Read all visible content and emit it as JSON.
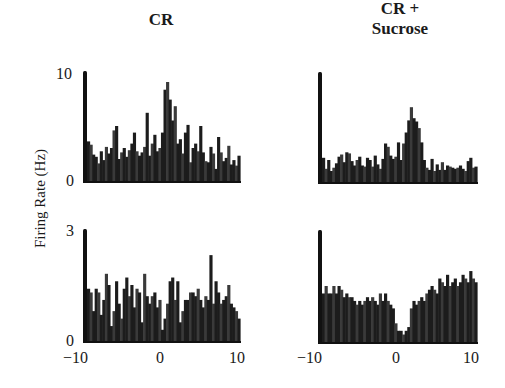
{
  "chart_data": [
    {
      "type": "bar",
      "panel": "top-left",
      "title": "CR",
      "ylabel": "Firing Rate (Hz)",
      "xlim": [
        -10,
        10
      ],
      "ylim": [
        0,
        10
      ],
      "yticks": [
        "0",
        "10"
      ],
      "xticks": [],
      "bin_start": -10,
      "bin_width": 0.333,
      "values": [
        3.6,
        3.3,
        2.4,
        2.2,
        1.6,
        2.7,
        1.9,
        3.1,
        2.5,
        3.0,
        4.6,
        5.0,
        2.0,
        2.6,
        3.0,
        2.2,
        2.8,
        3.4,
        4.4,
        2.7,
        2.3,
        2.6,
        3.1,
        6.2,
        2.3,
        3.4,
        4.2,
        2.7,
        3.0,
        4.4,
        8.3,
        9.0,
        7.4,
        5.5,
        6.8,
        3.4,
        3.8,
        2.5,
        4.4,
        5.1,
        1.7,
        3.0,
        3.4,
        2.7,
        5.0,
        2.6,
        1.8,
        1.7,
        3.1,
        2.5,
        1.1,
        4.0,
        2.6,
        1.8,
        2.1,
        3.2,
        1.5,
        1.9,
        1.4,
        2.3
      ]
    },
    {
      "type": "bar",
      "panel": "top-right",
      "title": "CR + Sucrose",
      "xlim": [
        -10,
        10
      ],
      "ylim": [
        0,
        10
      ],
      "yticks": [],
      "xticks": [],
      "bin_start": -10,
      "bin_width": 0.333,
      "values": [
        2.2,
        1.2,
        2.0,
        1.0,
        1.3,
        1.7,
        2.3,
        2.5,
        1.8,
        2.7,
        2.6,
        1.9,
        1.5,
        2.0,
        2.3,
        1.5,
        1.4,
        2.2,
        2.0,
        1.4,
        2.4,
        1.6,
        1.2,
        2.1,
        3.5,
        3.2,
        2.4,
        2.1,
        2.3,
        3.6,
        2.0,
        3.5,
        4.5,
        5.6,
        6.8,
        5.8,
        5.5,
        4.9,
        3.6,
        2.0,
        1.3,
        1.1,
        2.1,
        1.0,
        1.6,
        1.1,
        1.8,
        1.1,
        1.5,
        1.4,
        1.3,
        1.2,
        1.3,
        1.5,
        1.2,
        1.0,
        1.9,
        2.2,
        1.3,
        1.4
      ]
    },
    {
      "type": "bar",
      "panel": "bottom-left",
      "title": "CR",
      "xlim": [
        -10,
        10
      ],
      "ylim": [
        0,
        3
      ],
      "yticks": [
        "0",
        "3"
      ],
      "xticks": [
        "-10",
        "0",
        "10"
      ],
      "xlabel": "",
      "bin_start": -10,
      "bin_width": 0.333,
      "values": [
        1.4,
        1.3,
        0.8,
        1.4,
        1.3,
        0.7,
        1.1,
        1.8,
        1.5,
        0.4,
        0.8,
        1.6,
        1.0,
        0.6,
        1.4,
        1.7,
        1.2,
        1.5,
        0.9,
        1.4,
        1.3,
        0.5,
        1.8,
        1.2,
        1.0,
        1.2,
        1.3,
        0.9,
        1.1,
        0.3,
        0.6,
        1.0,
        1.6,
        1.7,
        1.1,
        1.6,
        0.5,
        0.8,
        1.1,
        1.1,
        1.3,
        1.3,
        1.2,
        1.4,
        1.1,
        0.9,
        1.2,
        1.1,
        2.3,
        1.0,
        1.6,
        1.3,
        1.0,
        1.1,
        1.2,
        1.5,
        1.0,
        0.9,
        0.8,
        0.6
      ]
    },
    {
      "type": "bar",
      "panel": "bottom-right",
      "title": "CR + Sucrose",
      "xlim": [
        -10,
        10
      ],
      "ylim": [
        0,
        3
      ],
      "yticks": [],
      "xticks": [
        "-10",
        "0",
        "10"
      ],
      "bin_start": -10,
      "bin_width": 0.333,
      "values": [
        1.3,
        1.5,
        1.3,
        1.3,
        1.5,
        1.3,
        1.5,
        1.4,
        1.2,
        1.3,
        1.2,
        1.2,
        1.1,
        1.0,
        1.1,
        1.0,
        1.1,
        1.2,
        1.1,
        1.2,
        1.1,
        1.0,
        1.3,
        1.1,
        1.3,
        1.1,
        1.0,
        0.9,
        0.5,
        0.3,
        0.3,
        0.2,
        0.3,
        0.4,
        0.9,
        1.1,
        1.0,
        1.1,
        1.2,
        1.1,
        1.3,
        1.4,
        1.5,
        1.4,
        1.3,
        1.7,
        1.6,
        1.5,
        1.8,
        1.5,
        1.6,
        1.7,
        1.5,
        1.6,
        1.8,
        1.7,
        1.6,
        1.9,
        1.7,
        1.6
      ]
    }
  ],
  "labels": {
    "col_left_title": "CR",
    "col_right_title_line1": "CR +",
    "col_right_title_line2": "Sucrose",
    "ylabel": "Firing Rate (Hz)",
    "top_ytick_max": "10",
    "top_ytick_min": "0",
    "bottom_ytick_max": "3",
    "bottom_ytick_min": "0",
    "xtick_left_min": "−10",
    "xtick_left_mid": "0",
    "xtick_left_max": "10",
    "xtick_right_min": "−10",
    "xtick_right_mid": "0",
    "xtick_right_max": "10"
  },
  "style": {
    "bar_color": "#1c1c1c",
    "axis_color": "#111111"
  }
}
